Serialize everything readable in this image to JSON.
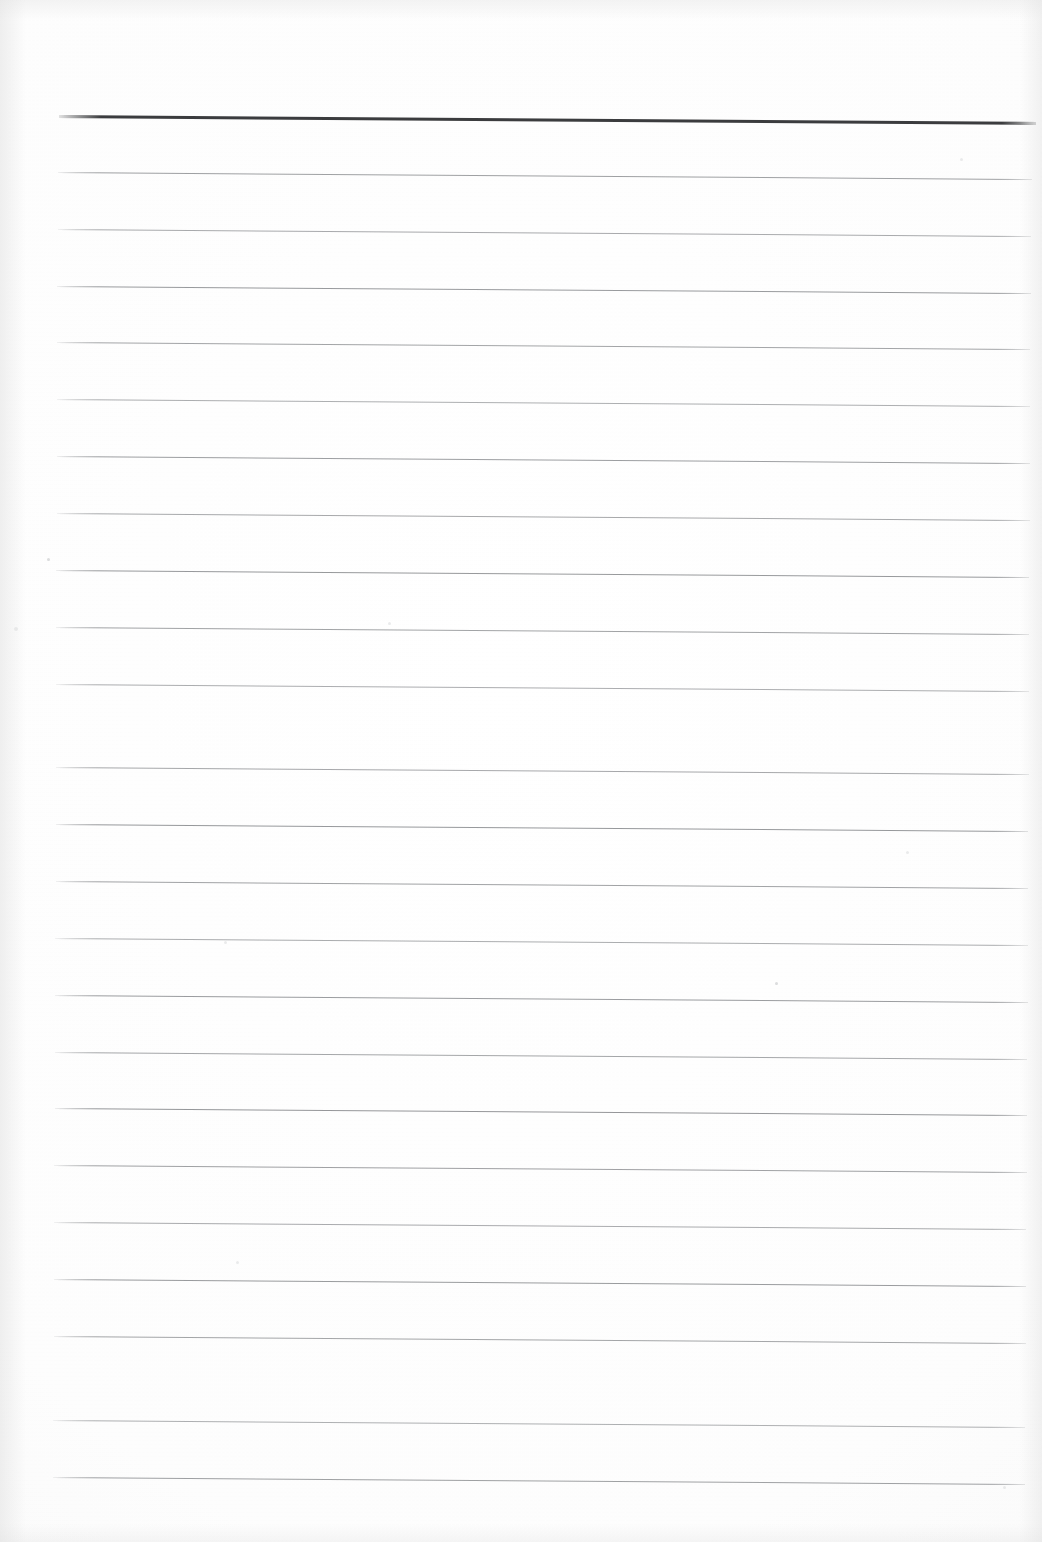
{
  "document": {
    "kind": "scanned-lined-paper",
    "title": "Blank Ruled Writing Paper",
    "orientation": "portrait",
    "page_width_px": 1042,
    "page_height_px": 1542,
    "visible_text": "",
    "handwriting_present": false
  },
  "paper": {
    "background_color": "#fefefe",
    "edge_shadow_color": "#e6e6e6",
    "scan_tilt_note": "ruled lines slope down ~7px from left to right across the page"
  },
  "ruling": {
    "line_color": "#8f9194",
    "header_line_color": "#3b3c3e",
    "line_count": 25,
    "header_line_index": 0,
    "line_thickness_px": 1,
    "header_line_thickness_px": 3,
    "left_margin_px": 56,
    "right_edge_px": 1032,
    "first_line_y_px": 115,
    "line_spacing_px": 56.8,
    "slope_drop_px": 7,
    "lines": [
      {
        "index": 0,
        "y": 115,
        "x_start": 59,
        "x_end": 1036,
        "weight": "bold"
      },
      {
        "index": 1,
        "y": 172,
        "x_start": 58,
        "x_end": 1032,
        "weight": "hairline"
      },
      {
        "index": 2,
        "y": 229,
        "x_start": 58,
        "x_end": 1031,
        "weight": "hairline"
      },
      {
        "index": 3,
        "y": 286,
        "x_start": 57,
        "x_end": 1031,
        "weight": "hairline"
      },
      {
        "index": 4,
        "y": 342,
        "x_start": 57,
        "x_end": 1030,
        "weight": "hairline"
      },
      {
        "index": 5,
        "y": 399,
        "x_start": 57,
        "x_end": 1030,
        "weight": "hairline"
      },
      {
        "index": 6,
        "y": 456,
        "x_start": 57,
        "x_end": 1030,
        "weight": "hairline"
      },
      {
        "index": 7,
        "y": 513,
        "x_start": 57,
        "x_end": 1030,
        "weight": "hairline"
      },
      {
        "index": 8,
        "y": 570,
        "x_start": 56,
        "x_end": 1029,
        "weight": "hairline"
      },
      {
        "index": 9,
        "y": 627,
        "x_start": 56,
        "x_end": 1029,
        "weight": "hairline"
      },
      {
        "index": 10,
        "y": 684,
        "x_start": 56,
        "x_end": 1029,
        "weight": "hairline"
      },
      {
        "index": 11,
        "y": 711,
        "x_start": 56,
        "x_end": 1029,
        "weight": "skip"
      },
      {
        "index": 12,
        "y": 767,
        "x_start": 56,
        "x_end": 1029,
        "weight": "hairline"
      },
      {
        "index": 13,
        "y": 824,
        "x_start": 56,
        "x_end": 1028,
        "weight": "hairline"
      },
      {
        "index": 14,
        "y": 881,
        "x_start": 56,
        "x_end": 1028,
        "weight": "hairline"
      },
      {
        "index": 15,
        "y": 938,
        "x_start": 55,
        "x_end": 1028,
        "weight": "hairline"
      },
      {
        "index": 16,
        "y": 995,
        "x_start": 55,
        "x_end": 1028,
        "weight": "hairline"
      },
      {
        "index": 17,
        "y": 1052,
        "x_start": 55,
        "x_end": 1027,
        "weight": "hairline"
      },
      {
        "index": 18,
        "y": 1108,
        "x_start": 55,
        "x_end": 1027,
        "weight": "hairline"
      },
      {
        "index": 19,
        "y": 1165,
        "x_start": 54,
        "x_end": 1027,
        "weight": "hairline"
      },
      {
        "index": 20,
        "y": 1222,
        "x_start": 54,
        "x_end": 1026,
        "weight": "hairline"
      },
      {
        "index": 21,
        "y": 1279,
        "x_start": 54,
        "x_end": 1026,
        "weight": "hairline"
      },
      {
        "index": 22,
        "y": 1336,
        "x_start": 54,
        "x_end": 1026,
        "weight": "hairline"
      },
      {
        "index": 23,
        "y": 1420,
        "x_start": 53,
        "x_end": 1025,
        "weight": "hairline"
      },
      {
        "index": 24,
        "y": 1477,
        "x_start": 53,
        "x_end": 1025,
        "weight": "hairline"
      }
    ]
  },
  "artifacts": {
    "specks": [
      {
        "x": 47,
        "y": 558,
        "size": 3,
        "soft": false
      },
      {
        "x": 14,
        "y": 627,
        "size": 4,
        "soft": true
      },
      {
        "x": 388,
        "y": 622,
        "size": 3,
        "soft": true
      },
      {
        "x": 906,
        "y": 851,
        "size": 3,
        "soft": true
      },
      {
        "x": 775,
        "y": 982,
        "size": 3,
        "soft": false
      },
      {
        "x": 224,
        "y": 941,
        "size": 3,
        "soft": true
      },
      {
        "x": 960,
        "y": 158,
        "size": 3,
        "soft": true
      },
      {
        "x": 1003,
        "y": 1486,
        "size": 3,
        "soft": true
      },
      {
        "x": 236,
        "y": 1261,
        "size": 3,
        "soft": true
      }
    ]
  }
}
